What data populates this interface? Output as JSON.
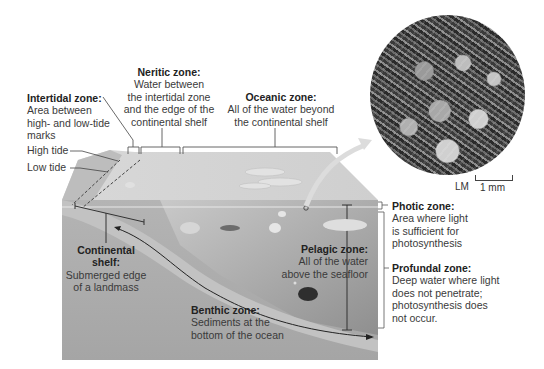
{
  "diagram": {
    "labels": {
      "intertidal": {
        "title": "Intertidal zone:",
        "lines": [
          "Area between",
          "high- and low-tide",
          "marks"
        ]
      },
      "neritic": {
        "title": "Neritic zone:",
        "lines": [
          "Water between",
          "the intertidal zone",
          "and the edge of the",
          "continental shelf"
        ]
      },
      "oceanic": {
        "title": "Oceanic zone:",
        "lines": [
          "All of the water beyond",
          "the continental shelf"
        ]
      },
      "high_tide": "High tide",
      "low_tide": "Low tide",
      "continental_shelf": {
        "title": "Continental",
        "title2": "shelf:",
        "lines": [
          "Submerged edge",
          "of a landmass"
        ]
      },
      "pelagic": {
        "title": "Pelagic zone:",
        "lines": [
          "All of the water",
          "above the seafloor"
        ]
      },
      "benthic": {
        "title": "Benthic zone:",
        "lines": [
          "Sediments at the",
          "bottom of the ocean"
        ]
      },
      "photic": {
        "title": "Photic zone:",
        "lines": [
          "Area where light",
          "is sufficient for",
          "photosynthesis"
        ]
      },
      "profundal": {
        "title": "Profundal zone:",
        "lines": [
          "Deep water where light",
          "does not penetrate;",
          "photosynthesis does",
          "not occur."
        ]
      }
    },
    "micrograph": {
      "type_label": "LM",
      "scale_label": "1 mm"
    },
    "colors": {
      "water_light": "#c9c9c9",
      "water_mid": "#a9a9a9",
      "water_dark": "#8c8c8c",
      "seafloor": "#bdbdbd",
      "line": "#444444"
    }
  }
}
